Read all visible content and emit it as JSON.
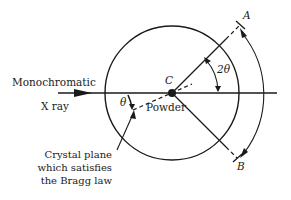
{
  "diagram": {
    "labels": {
      "source_line1": "Monochromatic",
      "source_line2": "X ray",
      "center": "C",
      "sample": "Powder",
      "point_a": "A",
      "point_b": "B",
      "angle_two_theta": "2θ",
      "angle_theta": "θ",
      "note_line1": "Crystal plane",
      "note_line2": "which satisfies",
      "note_line3": "the Bragg law"
    },
    "colors": {
      "stroke": "#1a1a1a",
      "background": "#ffffff"
    }
  }
}
